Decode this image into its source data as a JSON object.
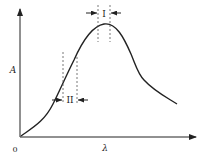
{
  "figure": {
    "type": "absorption-spectrum-diagram",
    "y_axis_label": "A",
    "x_axis_label": "λ",
    "origin_label": "0",
    "band_labels": {
      "peak_band": "I",
      "slope_band": "II"
    },
    "colors": {
      "background": "#ffffff",
      "line": "#222222",
      "dashed": "#555555"
    }
  }
}
